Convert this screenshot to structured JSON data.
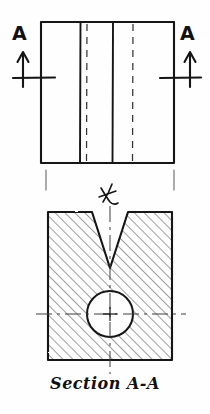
{
  "drawing": {
    "title": "Section A-A",
    "ink_color": "#141414",
    "paper_color": "#fefefe",
    "type": "engineering-sketch",
    "views": [
      {
        "name": "top-view",
        "description": "rectangular front view with cutting plane A-A",
        "outline": {
          "x": 41,
          "y": 22,
          "width": 133,
          "height": 141
        },
        "solid_internal_lines_x": [
          80,
          113
        ],
        "hidden_dashed_lines_x": [
          87,
          133
        ]
      },
      {
        "name": "section-view",
        "description": "Section A-A: V-notched block with through hole, cross hatched",
        "outline": {
          "x": 48,
          "y": 212,
          "width": 124,
          "height": 148
        },
        "v_notch": {
          "left_x": 48,
          "right_x": 152,
          "apex_x": 110,
          "apex_y": 268
        },
        "hole": {
          "cx": 110,
          "cy": 314,
          "r": 23
        },
        "hatch_angle_deg": 45
      }
    ],
    "cutting_plane": {
      "label_left": "A",
      "label_right": "A",
      "arrow_direction": "up",
      "arrow_left_x": 23,
      "arrow_right_x": 190
    },
    "centerline_symbol": "℄"
  },
  "labels": {
    "section_letter_left": "A",
    "section_letter_right": "A",
    "caption": "Section A-A"
  },
  "colors": {
    "ink": "#141414",
    "paper": "#fefefe",
    "hatch": "#2a2a2a",
    "thin_line": "#555555"
  }
}
